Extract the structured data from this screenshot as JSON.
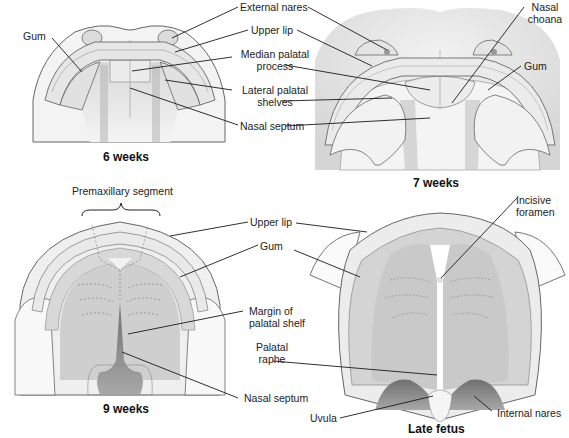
{
  "figure": {
    "topic": "Development of the palate",
    "panels": [
      {
        "id": "6-weeks",
        "caption": "6 weeks",
        "labels": {
          "gum": "Gum",
          "external_nares": "External nares",
          "upper_lip": "Upper lip",
          "median_palatal_process_1": "Median palatal",
          "median_palatal_process_2": "process",
          "lateral_palatal_shelves_1": "Lateral palatal",
          "lateral_palatal_shelves_2": "shelves",
          "nasal_septum": "Nasal septum"
        }
      },
      {
        "id": "7-weeks",
        "caption": "7 weeks",
        "labels": {
          "nasal_choana_1": "Nasal",
          "nasal_choana_2": "choana",
          "gum": "Gum"
        }
      },
      {
        "id": "9-weeks",
        "caption": "9 weeks",
        "labels": {
          "premaxillary_segment": "Premaxillary segment",
          "upper_lip": "Upper lip",
          "gum": "Gum",
          "margin_of_palatal_shelf_1": "Margin of",
          "margin_of_palatal_shelf_2": "palatal shelf",
          "palatal_raphe_1": "Palatal",
          "palatal_raphe_2": "raphe",
          "nasal_septum": "Nasal septum"
        }
      },
      {
        "id": "late-fetus",
        "caption": "Late fetus",
        "labels": {
          "incisive_foramen_1": "Incisive",
          "incisive_foramen_2": "foramen",
          "uvula": "Uvula",
          "internal_nares": "Internal nares"
        }
      }
    ],
    "colors": {
      "background": "#ffffff",
      "outline": "#555555",
      "light_tissue": "#ececec",
      "mid_tissue": "#d4d4d4",
      "dark_tissue": "#9a9a9a",
      "septum": "#7a7a7a",
      "leader_line": "#1a1a1a"
    }
  }
}
